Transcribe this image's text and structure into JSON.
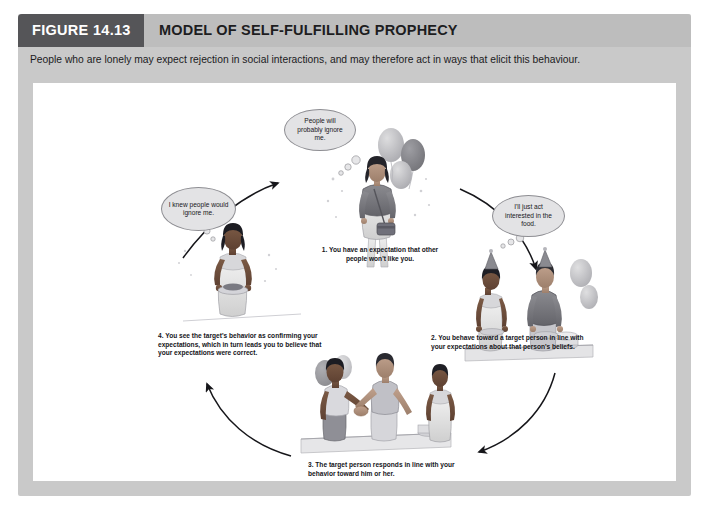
{
  "figure": {
    "label": "FIGURE 14.13",
    "title": "MODEL OF SELF-FULFILLING PROPHECY",
    "intro": "People who are lonely may expect rejection in social interactions, and may therefore act in ways that elicit this behaviour."
  },
  "colors": {
    "panel_bg": "#c9c9c9",
    "header_tab": "#555558",
    "header_strip": "#bdbdbd",
    "canvas": "#ffffff",
    "bubble_fill": "#e3e3e5",
    "bubble_stroke": "#8d8d92",
    "arrow": "#1a1a1a",
    "text": "#15151a"
  },
  "thought_bubbles": [
    {
      "id": "bubble-top",
      "text": "People will probably ignore me.",
      "lines": [
        "People",
        "will probably",
        "ignore me."
      ],
      "speaker": "step-1-woman"
    },
    {
      "id": "bubble-left",
      "text": "I knew people would ignore me.",
      "lines": [
        "I knew people",
        "would",
        "ignore me."
      ],
      "speaker": "step-4-woman"
    },
    {
      "id": "bubble-right",
      "text": "I'll just act interested in the food.",
      "lines": [
        "I'll just act",
        "interested",
        "in the food."
      ],
      "speaker": "step-2-woman"
    }
  ],
  "steps": [
    {
      "number": "1.",
      "text": "You have an expectation that other people won't like you.",
      "scene": "woman-alone-with-purse-at-party",
      "position": "top"
    },
    {
      "number": "2.",
      "text": "You behave toward a target person in line with your expectations about that person's beliefs.",
      "scene": "woman-and-man-at-buffet-table",
      "position": "right"
    },
    {
      "number": "3.",
      "text": "The target person responds in line with your behavior toward him or her.",
      "scene": "two-men-shaking-hands-woman-watching",
      "position": "bottom"
    },
    {
      "number": "4.",
      "text": "You see the target's behavior as confirming your expectations, which in turn leads you to believe that your expectations were correct.",
      "scene": "woman-holding-plate-of-food",
      "position": "left"
    }
  ],
  "flow": {
    "type": "cycle",
    "direction": "clockwise",
    "arrow_count": 4,
    "arrow_labels": [
      "step-4-to-step-1",
      "step-1-to-step-2",
      "step-2-to-step-3",
      "step-3-to-step-4"
    ]
  }
}
